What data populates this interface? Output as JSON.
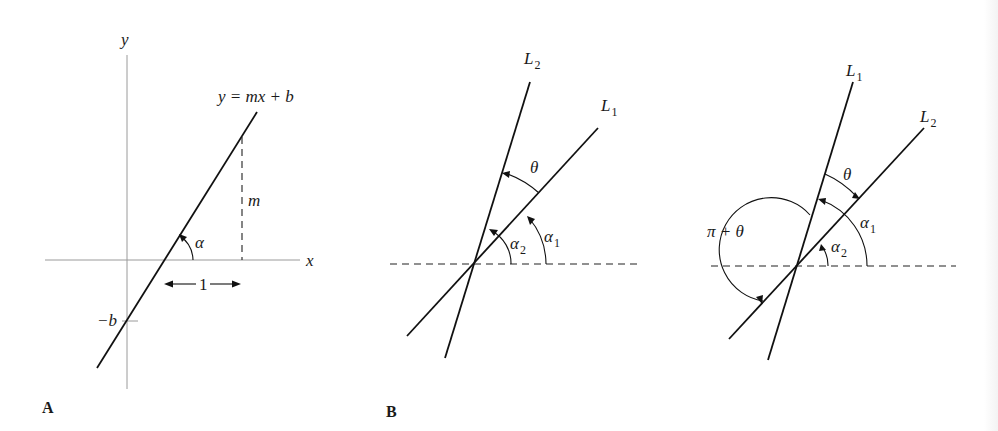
{
  "figure": {
    "panels": [
      {
        "id": "A",
        "label": "A",
        "axes": {
          "x_label": "x",
          "y_label": "y"
        },
        "line_equation": "y = mx + b",
        "annotations": {
          "slope_rise": "m",
          "run": "1",
          "intercept": "−b",
          "angle": "α"
        }
      },
      {
        "id": "B",
        "label": "B",
        "lines": {
          "first": {
            "name": "L",
            "sub": "1"
          },
          "second": {
            "name": "L",
            "sub": "2"
          }
        },
        "angles": {
          "theta": "θ",
          "alpha1": {
            "sym": "α",
            "sub": "1"
          },
          "alpha2": {
            "sym": "α",
            "sub": "2"
          }
        }
      },
      {
        "id": "C",
        "label": "",
        "lines": {
          "first": {
            "name": "L",
            "sub": "1"
          },
          "second": {
            "name": "L",
            "sub": "2"
          }
        },
        "angles": {
          "theta": "θ",
          "pi_plus_theta": "π + θ",
          "alpha1": {
            "sym": "α",
            "sub": "1"
          },
          "alpha2": {
            "sym": "α",
            "sub": "2"
          }
        }
      }
    ],
    "colors": {
      "ink": "#111111",
      "axis": "#9a9a9a",
      "background": "#ffffff"
    }
  }
}
